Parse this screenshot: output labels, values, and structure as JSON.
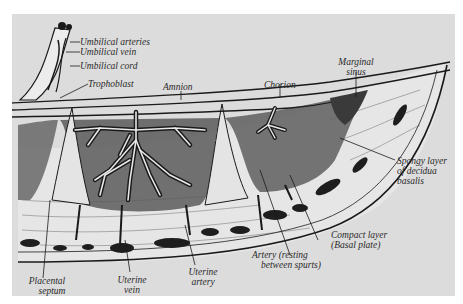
{
  "figure": {
    "background": "#dcdcdc",
    "ink": "#1a1a1a"
  },
  "labels": {
    "umbilical_arteries": "Umbilical arteries",
    "umbilical_vein": "Umbilical vein",
    "umbilical_cord": "Umbilical cord",
    "trophoblast": "Trophoblast",
    "amnion": "Amnion",
    "chorion": "Chorion",
    "marginal_sinus_1": "Marginal",
    "marginal_sinus_2": "sinus",
    "spongy_layer_1": "Spongy layer",
    "spongy_layer_2": "of decidua",
    "spongy_layer_3": "basalis",
    "compact_layer_1": "Compact layer",
    "compact_layer_2": "(Basal plate)",
    "artery_resting_1": "Artery (resting",
    "artery_resting_2": "between spurts)",
    "uterine_artery_1": "Uterine",
    "uterine_artery_2": "artery",
    "uterine_vein_1": "Uterine",
    "uterine_vein_2": "vein",
    "placental_septum_1": "Placental",
    "placental_septum_2": "septum"
  }
}
